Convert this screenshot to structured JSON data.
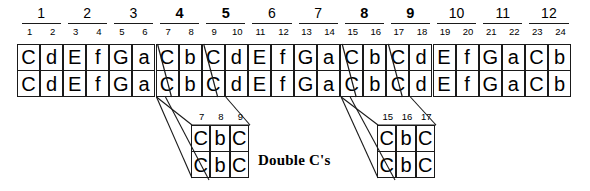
{
  "diagram": {
    "title_label": "Double C's",
    "ink_color": "#1a1a1a",
    "background_color": "#ffffff"
  },
  "measures": {
    "labels": [
      "1",
      "2",
      "3",
      "4",
      "5",
      "6",
      "7",
      "8",
      "9",
      "10",
      "11",
      "12"
    ],
    "bold_flags": [
      false,
      false,
      false,
      true,
      true,
      false,
      false,
      true,
      true,
      false,
      false,
      false
    ]
  },
  "beats": {
    "labels": [
      "1",
      "2",
      "3",
      "4",
      "5",
      "6",
      "7",
      "8",
      "9",
      "10",
      "11",
      "12",
      "13",
      "14",
      "15",
      "16",
      "17",
      "18",
      "19",
      "20",
      "21",
      "22",
      "23",
      "24"
    ]
  },
  "sequence": {
    "row_top": [
      "C",
      "d",
      "E",
      "f",
      "G",
      "a",
      "C",
      "b",
      "C",
      "d",
      "E",
      "f",
      "G",
      "a",
      "C",
      "b",
      "C",
      "d",
      "E",
      "f",
      "G",
      "a",
      "C",
      "b"
    ],
    "row_bottom": [
      "C",
      "d",
      "E",
      "f",
      "G",
      "a",
      "C",
      "b",
      "C",
      "d",
      "E",
      "f",
      "G",
      "a",
      "C",
      "b",
      "C",
      "d",
      "E",
      "f",
      "G",
      "a",
      "C",
      "b"
    ]
  },
  "callout_left": {
    "beats": [
      "7",
      "8",
      "9"
    ],
    "row_top": [
      "C",
      "b",
      "C"
    ],
    "row_bottom": [
      "C",
      "b",
      "C"
    ]
  },
  "callout_right": {
    "beats": [
      "15",
      "16",
      "17"
    ],
    "row_top": [
      "C",
      "b",
      "C"
    ],
    "row_bottom": [
      "C",
      "b",
      "C"
    ]
  }
}
